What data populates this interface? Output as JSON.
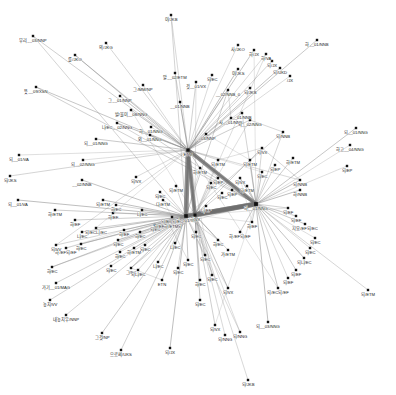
{
  "figure": {
    "type": "network-graph",
    "title": "",
    "background_color": "#ffffff",
    "node_color": "#111111",
    "edge_color": "#8a8a8a",
    "width": 396,
    "height": 395
  },
  "chart_data": {
    "type": "scatter",
    "title": "",
    "xlabel": "",
    "ylabel": "",
    "grid": false,
    "legend": false,
    "nodes": [
      {
        "id": "n0",
        "label": "무리__03/NNP",
        "x": 33,
        "y": 36,
        "size": 2.4
      },
      {
        "id": "n1",
        "label": "의/JKG",
        "x": 106,
        "y": 43,
        "size": 2.4
      },
      {
        "id": "n2",
        "label": "를/JKO",
        "x": 75,
        "y": 55,
        "size": 2.4
      },
      {
        "id": "n3",
        "label": "뜻__09/XSN",
        "x": 36,
        "y": 87,
        "size": 2.4
      },
      {
        "id": "n4",
        "label": "그/MM/NP",
        "x": 143,
        "y": 85,
        "size": 2.4
      },
      {
        "id": "n5",
        "label": "그__01/NNP",
        "x": 120,
        "y": 96,
        "size": 2.4
      },
      {
        "id": "n6",
        "label": "말__02/ETM",
        "x": 175,
        "y": 73,
        "size": 2.4
      },
      {
        "id": "n7",
        "label": "것__01/VX",
        "x": 196,
        "y": 82,
        "size": 2.4
      },
      {
        "id": "n8",
        "label": "되/EC",
        "x": 212,
        "y": 75,
        "size": 2.4
      },
      {
        "id": "n9",
        "label": "__02/NNB_0",
        "x": 228,
        "y": 90,
        "size": 2.4
      },
      {
        "id": "n10",
        "label": "발/물이__08/NNG",
        "x": 131,
        "y": 110,
        "size": 2.4
      },
      {
        "id": "n11",
        "label": "__01/NNB",
        "x": 180,
        "y": 102,
        "size": 2.4
      },
      {
        "id": "n12",
        "label": "나/EC__02/NNG",
        "x": 117,
        "y": 123,
        "size": 2.4
      },
      {
        "id": "n13",
        "label": "하__01/NNG",
        "x": 151,
        "y": 127,
        "size": 2.4
      },
      {
        "id": "n14",
        "label": "외__01/NNG",
        "x": 150,
        "y": 135,
        "size": 2.4
      },
      {
        "id": "n15",
        "label": "__03/NNP",
        "x": 206,
        "y": 134,
        "size": 2.4
      },
      {
        "id": "n16",
        "label": "ETM",
        "x": 188,
        "y": 150,
        "size": 3.2
      },
      {
        "id": "n17",
        "label": "사__01/NNB",
        "x": 231,
        "y": 118,
        "size": 2.4
      },
      {
        "id": "n18",
        "label": "되__02/NNG",
        "x": 250,
        "y": 120,
        "size": 2.4
      },
      {
        "id": "n19",
        "label": "사/JKO",
        "x": 238,
        "y": 45,
        "size": 2.4
      },
      {
        "id": "n20",
        "label": "하/JX",
        "x": 254,
        "y": 50,
        "size": 2.4
      },
      {
        "id": "n21",
        "label": "하/VA",
        "x": 266,
        "y": 54,
        "size": 2.4
      },
      {
        "id": "n22",
        "label": "되/JX",
        "x": 272,
        "y": 61,
        "size": 2.4
      },
      {
        "id": "n23",
        "label": "되/UKD",
        "x": 280,
        "y": 68,
        "size": 2.4
      },
      {
        "id": "n24",
        "label": "/JX",
        "x": 290,
        "y": 76,
        "size": 2.4
      },
      {
        "id": "n25",
        "label": "이/JKS",
        "x": 238,
        "y": 69,
        "size": 2.4
      },
      {
        "id": "n26",
        "label": "되/JKB",
        "x": 250,
        "y": 88,
        "size": 2.4
      },
      {
        "id": "n27",
        "label": "__01/NNB",
        "x": 242,
        "y": 113,
        "size": 2.4
      },
      {
        "id": "n28",
        "label": "하__01/NNB",
        "x": 317,
        "y": 40,
        "size": 2.4
      },
      {
        "id": "n29",
        "label": "이/JKB",
        "x": 171,
        "y": 15,
        "size": 2.4
      },
      {
        "id": "n30",
        "label": "되__01/NNG",
        "x": 356,
        "y": 128,
        "size": 2.4
      },
      {
        "id": "n31",
        "label": "하고__04/NNG",
        "x": 350,
        "y": 145,
        "size": 2.4
      },
      {
        "id": "n32",
        "label": "되/EP",
        "x": 347,
        "y": 166,
        "size": 2.4
      },
      {
        "id": "n33",
        "label": "되__01/NNG",
        "x": 96,
        "y": 139,
        "size": 2.4
      },
      {
        "id": "n34",
        "label": "되__01/VA",
        "x": 19,
        "y": 155,
        "size": 2.4
      },
      {
        "id": "n35",
        "label": "되/JKS",
        "x": 10,
        "y": 176,
        "size": 2.4
      },
      {
        "id": "n36",
        "label": "되__01/VA",
        "x": 18,
        "y": 200,
        "size": 2.4
      },
      {
        "id": "n37",
        "label": "되__02/NNG",
        "x": 83,
        "y": 160,
        "size": 2.4
      },
      {
        "id": "n38",
        "label": "__02/NNB",
        "x": 82,
        "y": 180,
        "size": 2.4
      },
      {
        "id": "n39",
        "label": "되/VX",
        "x": 136,
        "y": 177,
        "size": 2.4
      },
      {
        "id": "n40",
        "label": "되/EP",
        "x": 275,
        "y": 165,
        "size": 2.4
      },
      {
        "id": "n41",
        "label": "하/ETM",
        "x": 293,
        "y": 158,
        "size": 2.4
      },
      {
        "id": "n42",
        "label": "되/ETM",
        "x": 250,
        "y": 160,
        "size": 2.4
      },
      {
        "id": "n43",
        "label": "되/NNB",
        "x": 300,
        "y": 180,
        "size": 2.4
      },
      {
        "id": "n44",
        "label": "되/VX",
        "x": 240,
        "y": 178,
        "size": 2.4
      },
      {
        "id": "n45",
        "label": "되/EP",
        "x": 232,
        "y": 190,
        "size": 2.4
      },
      {
        "id": "n46",
        "label": "다/ETM",
        "x": 247,
        "y": 186,
        "size": 2.4
      },
      {
        "id": "n47",
        "label": "되/EC",
        "x": 222,
        "y": 193,
        "size": 2.4
      },
      {
        "id": "n48",
        "label": "니/EC",
        "x": 142,
        "y": 210,
        "size": 2.4
      },
      {
        "id": "n49",
        "label": "다/ETM",
        "x": 163,
        "y": 200,
        "size": 2.4
      },
      {
        "id": "n50",
        "label": "하/EF",
        "x": 113,
        "y": 213,
        "size": 2.4
      },
      {
        "id": "n51",
        "label": "하/EC",
        "x": 116,
        "y": 205,
        "size": 2.4
      },
      {
        "id": "n52",
        "label": "되/ETM",
        "x": 103,
        "y": 200,
        "size": 2.4
      },
      {
        "id": "n53",
        "label": "되/EC니/EC",
        "x": 96,
        "y": 228,
        "size": 2.4
      },
      {
        "id": "n54",
        "label": "하/EF",
        "x": 124,
        "y": 230,
        "size": 2.4
      },
      {
        "id": "n55",
        "label": "하/EC",
        "x": 140,
        "y": 232,
        "size": 2.4
      },
      {
        "id": "n56",
        "label": "되/EC",
        "x": 155,
        "y": 225,
        "size": 2.4
      },
      {
        "id": "n57",
        "label": "하__01/VX",
        "x": 186,
        "y": 216,
        "size": 3.6
      },
      {
        "id": "n58",
        "label": "되/EC되/EC",
        "x": 172,
        "y": 217,
        "size": 2.4
      },
      {
        "id": "n59",
        "label": "하/EF하/ETM되",
        "x": 168,
        "y": 222,
        "size": 2.4
      },
      {
        "id": "n60",
        "label": "니/EF",
        "x": 206,
        "y": 206,
        "size": 2.4
      },
      {
        "id": "n61",
        "label": "되/EC",
        "x": 196,
        "y": 232,
        "size": 2.4
      },
      {
        "id": "n62",
        "label": "니/EC",
        "x": 175,
        "y": 243,
        "size": 2.4
      },
      {
        "id": "n63",
        "label": "되/EC",
        "x": 145,
        "y": 245,
        "size": 2.4
      },
      {
        "id": "n64",
        "label": "하/ETM",
        "x": 134,
        "y": 248,
        "size": 2.4
      },
      {
        "id": "n65",
        "label": "하/EC",
        "x": 120,
        "y": 252,
        "size": 2.4
      },
      {
        "id": "n66",
        "label": "되/EC",
        "x": 111,
        "y": 266,
        "size": 2.4
      },
      {
        "id": "n67",
        "label": "그/EC",
        "x": 131,
        "y": 268,
        "size": 2.4
      },
      {
        "id": "n68",
        "label": "되/EC",
        "x": 118,
        "y": 240,
        "size": 2.4
      },
      {
        "id": "n69",
        "label": "하/EC",
        "x": 81,
        "y": 244,
        "size": 2.4
      },
      {
        "id": "n70",
        "label": "하/EF되/EF",
        "x": 66,
        "y": 248,
        "size": 2.4
      },
      {
        "id": "n71",
        "label": "니/EC",
        "x": 82,
        "y": 232,
        "size": 2.4
      },
      {
        "id": "n72",
        "label": "하/EF",
        "x": 75,
        "y": 220,
        "size": 2.4
      },
      {
        "id": "n73",
        "label": "하/ETM",
        "x": 55,
        "y": 210,
        "size": 2.4
      },
      {
        "id": "n74",
        "label": "되/VV",
        "x": 56,
        "y": 245,
        "size": 2.4
      },
      {
        "id": "n75",
        "label": "하/EC",
        "x": 52,
        "y": 267,
        "size": 2.4
      },
      {
        "id": "n76",
        "label": "가기__01/MAG",
        "x": 56,
        "y": 283,
        "size": 2.4
      },
      {
        "id": "n77",
        "label": "놓치/VV",
        "x": 50,
        "y": 300,
        "size": 2.4
      },
      {
        "id": "n78",
        "label": "내놓치우/NNP",
        "x": 66,
        "y": 315,
        "size": 2.4
      },
      {
        "id": "n79",
        "label": "그것/NP",
        "x": 102,
        "y": 333,
        "size": 2.4
      },
      {
        "id": "n80",
        "label": "으로써/UKS",
        "x": 121,
        "y": 350,
        "size": 2.4
      },
      {
        "id": "n81",
        "label": "되니/EC",
        "x": 138,
        "y": 270,
        "size": 2.4
      },
      {
        "id": "n82",
        "label": "니/EC",
        "x": 158,
        "y": 262,
        "size": 2.4
      },
      {
        "id": "n83",
        "label": "되/EC",
        "x": 178,
        "y": 268,
        "size": 2.4
      },
      {
        "id": "n84",
        "label": "ETN",
        "x": 162,
        "y": 280,
        "size": 2.4
      },
      {
        "id": "n85",
        "label": "되/EC",
        "x": 188,
        "y": 260,
        "size": 2.4
      },
      {
        "id": "n86",
        "label": "되/JX",
        "x": 170,
        "y": 348,
        "size": 2.4
      },
      {
        "id": "n87",
        "label": "되/VX",
        "x": 215,
        "y": 325,
        "size": 2.4
      },
      {
        "id": "n88",
        "label": "되/NNG",
        "x": 225,
        "y": 335,
        "size": 2.4
      },
      {
        "id": "n89",
        "label": "되/NNG",
        "x": 240,
        "y": 332,
        "size": 2.4
      },
      {
        "id": "n90",
        "label": "되__03/NNG",
        "x": 268,
        "y": 322,
        "size": 2.4
      },
      {
        "id": "n91",
        "label": "되/JKB",
        "x": 248,
        "y": 380,
        "size": 2.4
      },
      {
        "id": "n92",
        "label": "되/EF",
        "x": 288,
        "y": 208,
        "size": 2.4
      },
      {
        "id": "n93",
        "label": "되/EF",
        "x": 296,
        "y": 216,
        "size": 2.4
      },
      {
        "id": "n94",
        "label": "지요/EF되/EC",
        "x": 305,
        "y": 224,
        "size": 2.4
      },
      {
        "id": "n95",
        "label": "되/EC",
        "x": 315,
        "y": 238,
        "size": 2.4
      },
      {
        "id": "n96",
        "label": "되/EC",
        "x": 310,
        "y": 248,
        "size": 2.4
      },
      {
        "id": "n97",
        "label": "되니/EC",
        "x": 304,
        "y": 258,
        "size": 2.4
      },
      {
        "id": "n98",
        "label": "되/EF",
        "x": 296,
        "y": 270,
        "size": 2.4
      },
      {
        "id": "n99",
        "label": "되/EF",
        "x": 288,
        "y": 278,
        "size": 2.4
      },
      {
        "id": "n100",
        "label": "되/EC되/EF",
        "x": 278,
        "y": 288,
        "size": 2.4
      },
      {
        "id": "n101",
        "label": "되/ETM",
        "x": 368,
        "y": 290,
        "size": 2.4
      },
      {
        "id": "n102",
        "label": "하__01/NNG",
        "x": 256,
        "y": 204,
        "size": 3.8
      },
      {
        "id": "n103",
        "label": "하/EF",
        "x": 252,
        "y": 222,
        "size": 2.4
      },
      {
        "id": "n104",
        "label": "하/EF되/EF",
        "x": 240,
        "y": 232,
        "size": 2.4
      },
      {
        "id": "n105",
        "label": "가/ETM",
        "x": 228,
        "y": 250,
        "size": 2.4
      },
      {
        "id": "n106",
        "label": "하/EC",
        "x": 218,
        "y": 240,
        "size": 2.4
      },
      {
        "id": "n107",
        "label": "되/EC",
        "x": 205,
        "y": 255,
        "size": 2.4
      },
      {
        "id": "n108",
        "label": "되/VX",
        "x": 228,
        "y": 288,
        "size": 2.4
      },
      {
        "id": "n109",
        "label": "되/EC",
        "x": 212,
        "y": 275,
        "size": 2.4
      },
      {
        "id": "n110",
        "label": "되/EC",
        "x": 200,
        "y": 300,
        "size": 2.4
      },
      {
        "id": "n111",
        "label": "하/VX",
        "x": 195,
        "y": 215,
        "size": 3.0
      },
      {
        "id": "n112",
        "label": "되/NNB",
        "x": 283,
        "y": 132,
        "size": 2.4
      },
      {
        "id": "n113",
        "label": "되/VX",
        "x": 262,
        "y": 148,
        "size": 2.4
      },
      {
        "id": "n114",
        "label": "되/ETM",
        "x": 218,
        "y": 160,
        "size": 2.4
      },
      {
        "id": "n115",
        "label": "하/ETM",
        "x": 200,
        "y": 168,
        "size": 2.4
      },
      {
        "id": "n116",
        "label": "되/EC",
        "x": 211,
        "y": 183,
        "size": 2.4
      },
      {
        "id": "n117",
        "label": "되/EP",
        "x": 218,
        "y": 178,
        "size": 2.4
      },
      {
        "id": "n118",
        "label": "하/NNB",
        "x": 300,
        "y": 190,
        "size": 2.4
      },
      {
        "id": "n119",
        "label": "되/EC",
        "x": 262,
        "y": 172,
        "size": 2.4
      },
      {
        "id": "n120",
        "label": "되/ETM",
        "x": 176,
        "y": 186,
        "size": 2.4
      },
      {
        "id": "n121",
        "label": "되/EC",
        "x": 160,
        "y": 192,
        "size": 2.4
      },
      {
        "id": "n122",
        "label": "하/EC",
        "x": 200,
        "y": 280,
        "size": 2.4
      }
    ],
    "hubs": [
      "n16",
      "n57",
      "n102",
      "n111"
    ],
    "edge_count": 260,
    "node_count": 123,
    "pos_tags": [
      "NNG",
      "NNB",
      "NNP",
      "NP",
      "VV",
      "VA",
      "VX",
      "MAG",
      "EC",
      "EF",
      "EP",
      "ETM",
      "ETN",
      "JKS",
      "JKO",
      "JKB",
      "JKG",
      "JX",
      "XSN",
      "UKS",
      "UKD",
      "MM"
    ]
  }
}
